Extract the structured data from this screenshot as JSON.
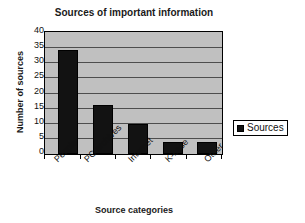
{
  "chart_data": {
    "type": "bar",
    "title": "Sources of important information",
    "xlabel": "Source categories",
    "ylabel": "Number of sources",
    "categories": [
      "People",
      "PC archives",
      "Internet",
      "K-base",
      "Other"
    ],
    "values": [
      34,
      16,
      10,
      4,
      4
    ],
    "series": [
      {
        "name": "Sources",
        "values": [
          34,
          16,
          10,
          4,
          4
        ]
      }
    ],
    "ylim": [
      0,
      40
    ],
    "yticks": [
      0,
      5,
      10,
      15,
      20,
      25,
      30,
      35,
      40
    ],
    "ytick_labels": [
      "0",
      "5",
      "10",
      "15",
      "20",
      "25",
      "30",
      "35",
      "40"
    ],
    "grid": true,
    "grid_axis": "y",
    "legend_position": "right",
    "legend_entries": [
      "Sources"
    ],
    "colors": {
      "bar": "#121212",
      "plot_background": "#c0c0c0",
      "gridline": "#4d4d4d",
      "axis": "#000000",
      "text": "#111111",
      "figure_background": "#ffffff"
    }
  }
}
